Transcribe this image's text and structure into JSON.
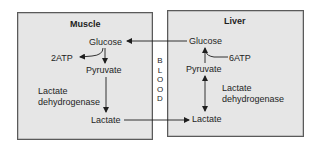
{
  "muscle": {
    "title": "Muscle",
    "glucose": "Glucose",
    "atp": "2ATP",
    "pyruvate": "Pyruvate",
    "enzyme_line1": "Lactate",
    "enzyme_line2": "dehydrogenase",
    "lactate": "Lactate"
  },
  "liver": {
    "title": "Liver",
    "glucose": "Glucose",
    "atp": "6ATP",
    "pyruvate": "Pyruvate",
    "enzyme_line1": "Lactate",
    "enzyme_line2": "dehydrogenase",
    "lactate": "Lactate"
  },
  "blood": {
    "letters": [
      "B",
      "L",
      "O",
      "O",
      "D"
    ]
  },
  "colors": {
    "box_fill": "#e6e6e6",
    "box_border": "#5a5a5a",
    "line": "#1e1e1e"
  }
}
